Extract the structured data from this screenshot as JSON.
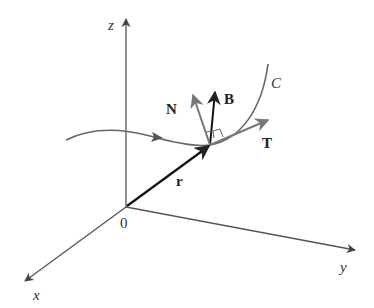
{
  "diagram": {
    "axes": {
      "z_label": "z",
      "y_label": "y",
      "x_label": "x",
      "origin_label": "0"
    },
    "curve_label": "C",
    "vectors": {
      "position": "r",
      "tangent": "T",
      "normal": "N",
      "binormal": "B"
    },
    "colors": {
      "axes": "#555555",
      "curve": "#666666",
      "position_vector": "#111111",
      "binormal": "#111111",
      "tangent": "#777777",
      "normal": "#777777"
    }
  }
}
